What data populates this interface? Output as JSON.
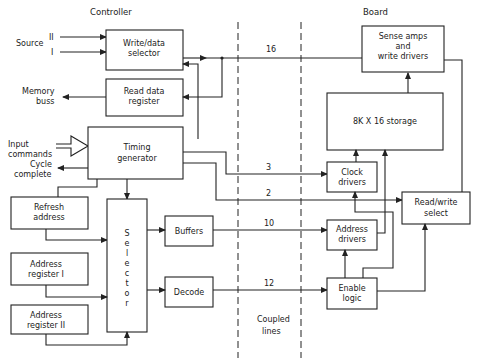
{
  "headers": {
    "controller": "Controller",
    "board": "Board",
    "coupled_lines_1": "Coupled",
    "coupled_lines_2": "lines"
  },
  "inputs": {
    "source": "Source",
    "source_ii": "II",
    "source_i": "I",
    "memory_buss_1": "Memory",
    "memory_buss_2": "buss",
    "input_commands_1": "Input",
    "input_commands_2": "commands",
    "cycle_complete_1": "Cycle",
    "cycle_complete_2": "complete"
  },
  "blocks": {
    "write_data_selector": [
      "Write/data",
      "selector"
    ],
    "read_data_register": [
      "Read data",
      "register"
    ],
    "timing_generator": [
      "Timing",
      "generator"
    ],
    "refresh_address": [
      "Refresh",
      "address"
    ],
    "address_register_i": [
      "Address",
      "register  I"
    ],
    "address_register_ii": [
      "Address",
      "register  II"
    ],
    "selector": [
      "S",
      "e",
      "l",
      "e",
      "c",
      "t",
      "o",
      "r"
    ],
    "buffers": [
      "Buffers"
    ],
    "decode": [
      "Decode"
    ],
    "sense_amps": [
      "Sense amps",
      "and",
      "write drivers"
    ],
    "storage": [
      "8K X 16  storage"
    ],
    "clock_drivers": [
      "Clock",
      "drivers"
    ],
    "address_drivers": [
      "Address",
      "drivers"
    ],
    "enable_logic": [
      "Enable",
      "logic"
    ],
    "read_write_select": [
      "Read/write",
      "select"
    ]
  },
  "bus_widths": {
    "data": "16",
    "clock": "3",
    "read_write": "2",
    "address": "10",
    "enable": "12"
  }
}
